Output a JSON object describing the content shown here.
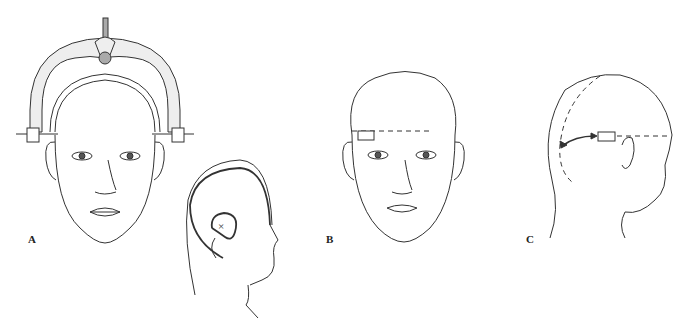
{
  "figure": {
    "panels": [
      {
        "id": "A",
        "label": "A",
        "description": "Frontal view of head with stereotactic head frame arch and side pins; inset lateral view with marked region (x)"
      },
      {
        "id": "B",
        "label": "B",
        "description": "Frontal view of head with rectangle marker and horizontal dashed line at forehead level"
      },
      {
        "id": "C",
        "label": "C",
        "description": "Lateral-posterior view of head with rectangle, dashed lines and curved double-headed arrow"
      }
    ],
    "inset": {
      "marker": "×"
    },
    "colors": {
      "stroke": "#333333",
      "arch_fill": "#eeeeee",
      "knob_fill": "#aaaaaa",
      "background": "#ffffff"
    }
  }
}
